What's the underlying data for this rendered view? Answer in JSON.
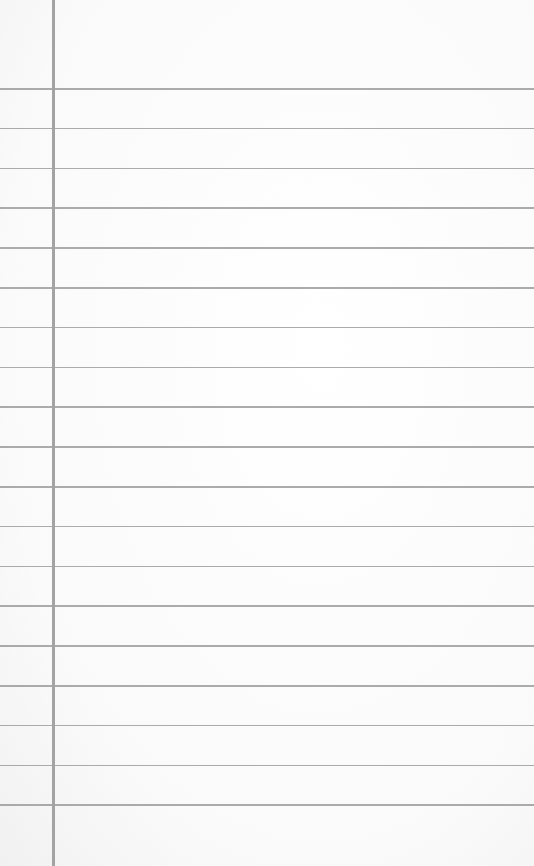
{
  "paper": {
    "type": "ruled-notebook-page",
    "background_color": "#fbfbfb",
    "rule_color": "#9c9c9c",
    "margin_color": "#a3a3a3",
    "margin_x": 52,
    "first_rule_y": 88,
    "rule_spacing": 39.8,
    "rule_count": 19
  }
}
